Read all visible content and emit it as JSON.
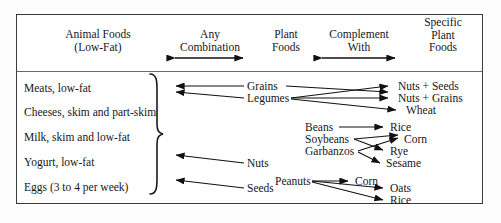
{
  "diagram": {
    "border_color": "#3a3a3a",
    "background_color": "#ffffff",
    "ink_color": "#16161a"
  },
  "headers": [
    {
      "id": "animal-foods",
      "label": "Animal Foods\n(Low-Fat)"
    },
    {
      "id": "any-combination",
      "label": "Any\nCombination"
    },
    {
      "id": "plant-foods",
      "label": "Plant\nFoods"
    },
    {
      "id": "complement-with",
      "label": "Complement\nWith"
    },
    {
      "id": "specific-plant-foods",
      "label": "Specific\nPlant\nFoods"
    }
  ],
  "header_arrows": [
    {
      "id": "any-combination-arrow",
      "type": "double-headed"
    },
    {
      "id": "complement-with-arrow",
      "type": "double-headed"
    }
  ],
  "animal_foods": [
    {
      "id": "meats",
      "label": "Meats, low-fat"
    },
    {
      "id": "cheeses",
      "label": "Cheeses, skim and part-skim"
    },
    {
      "id": "milk",
      "label": "Milk, skim and low-fat"
    },
    {
      "id": "yogurt",
      "label": "Yogurt, low-fat"
    },
    {
      "id": "eggs",
      "label": "Eggs (3 to 4 per week)"
    }
  ],
  "brace": {
    "glyph": "}"
  },
  "plant_foods": [
    {
      "id": "grains",
      "label": "Grains"
    },
    {
      "id": "legumes",
      "label": "Legumes"
    },
    {
      "id": "beans",
      "label": "Beans"
    },
    {
      "id": "soybeans",
      "label": "Soybeans"
    },
    {
      "id": "garbanzos",
      "label": "Garbanzos"
    },
    {
      "id": "nuts",
      "label": "Nuts"
    },
    {
      "id": "peanuts",
      "label": "Peanuts"
    },
    {
      "id": "seeds",
      "label": "Seeds"
    }
  ],
  "specific_plant_foods": [
    {
      "id": "nuts-seeds",
      "label": "Nuts + Seeds"
    },
    {
      "id": "nuts-grains",
      "label": "Nuts + Grains"
    },
    {
      "id": "wheat",
      "label": "Wheat"
    },
    {
      "id": "rice-upper",
      "label": "Rice"
    },
    {
      "id": "corn-upper",
      "label": "Corn"
    },
    {
      "id": "rye",
      "label": "Rye"
    },
    {
      "id": "sesame",
      "label": "Sesame"
    },
    {
      "id": "corn-lower",
      "label": "Corn"
    },
    {
      "id": "oats",
      "label": "Oats"
    },
    {
      "id": "rice-lower",
      "label": "Rice"
    }
  ],
  "connections": [
    {
      "from": "grains",
      "to": "animal-foods-group",
      "direction": "left"
    },
    {
      "from": "legumes",
      "to": "animal-foods-group",
      "direction": "left"
    },
    {
      "from": "nuts",
      "to": "animal-foods-group",
      "direction": "left"
    },
    {
      "from": "seeds",
      "to": "animal-foods-group",
      "direction": "left"
    },
    {
      "from": "legumes",
      "to": "nuts-seeds",
      "direction": "right"
    },
    {
      "from": "legumes",
      "to": "nuts-grains",
      "direction": "right"
    },
    {
      "from": "legumes",
      "to": "wheat",
      "direction": "right"
    },
    {
      "from": "grains",
      "to": "nuts-seeds",
      "direction": "right"
    },
    {
      "from": "beans",
      "to": "rice-upper",
      "direction": "right"
    },
    {
      "from": "soybeans",
      "to": "corn-upper",
      "direction": "right"
    },
    {
      "from": "soybeans",
      "to": "rye",
      "direction": "right"
    },
    {
      "from": "garbanzos",
      "to": "sesame",
      "direction": "right"
    },
    {
      "from": "garbanzos",
      "to": "corn-upper",
      "direction": "right"
    },
    {
      "from": "peanuts",
      "to": "corn-lower",
      "direction": "right"
    },
    {
      "from": "peanuts",
      "to": "oats",
      "direction": "right"
    },
    {
      "from": "peanuts",
      "to": "rice-lower",
      "direction": "right"
    }
  ]
}
